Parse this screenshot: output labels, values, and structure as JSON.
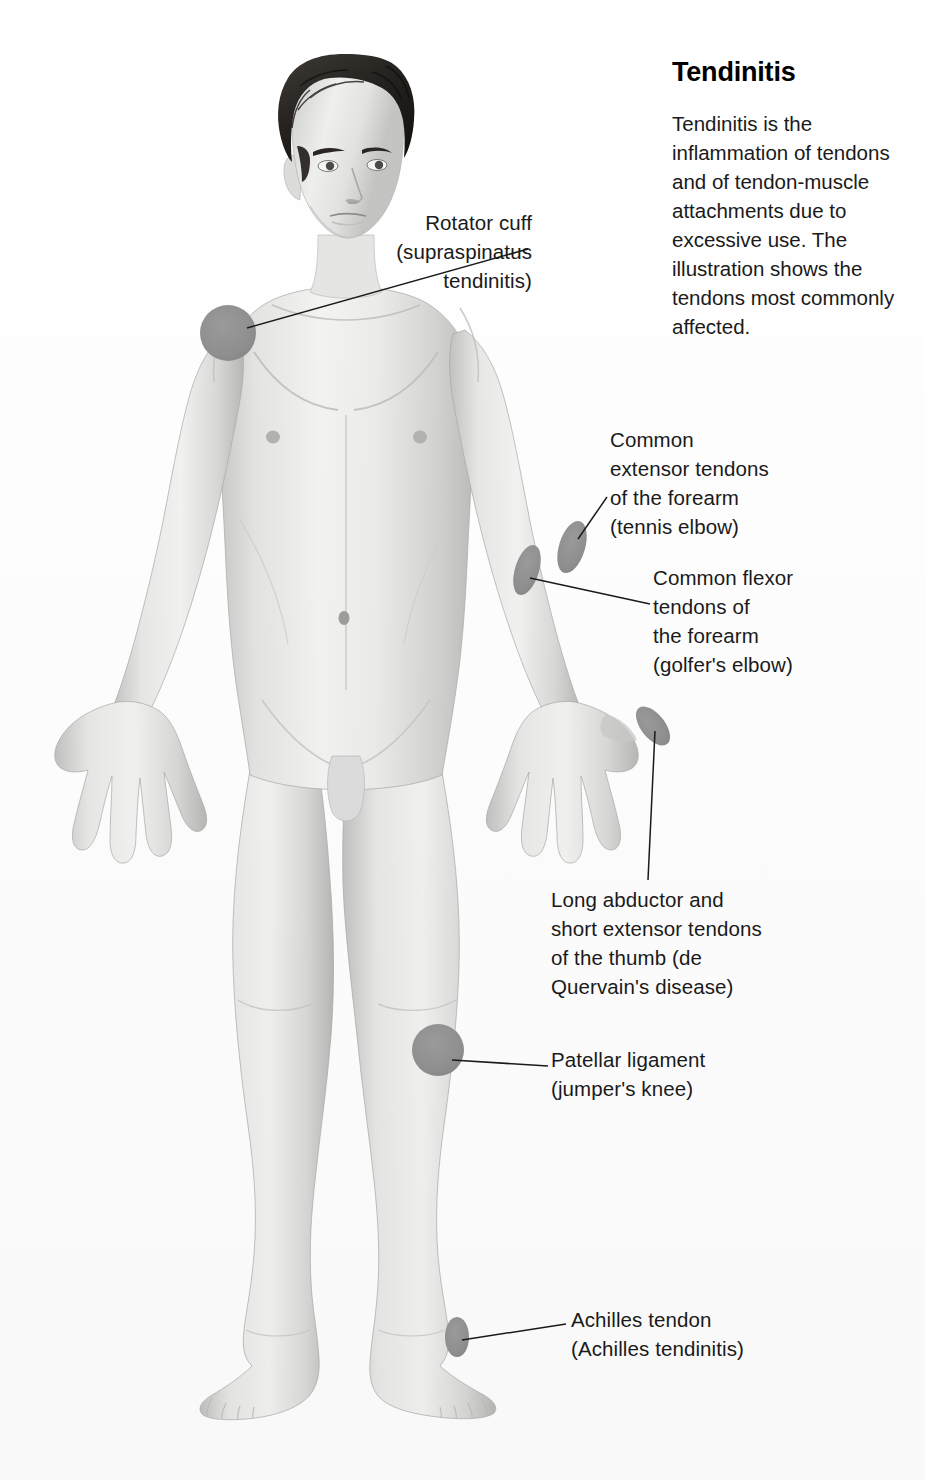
{
  "header": {
    "title": "Tendinitis",
    "body": "Tendinitis is the inflammation of tendons and of tendon-muscle attachments due to excessive use. The illustration shows the tendons most commonly affected."
  },
  "illustration": {
    "subject": "anterior view of standing male human figure, grayscale anatomical illustration",
    "marker_color": "#8e8e8e",
    "leader_line_color": "#1a1a1a",
    "skin_light": "#f2f2f0",
    "skin_mid": "#d8d8d6",
    "skin_shadow": "#b4b4b2",
    "hair_color": "#2a2724"
  },
  "callouts": [
    {
      "id": "rotator",
      "text": "Rotator cuff\n(supraspinatus\ntendinitis)",
      "align": "right",
      "marker": "shoulder-marker"
    },
    {
      "id": "extensor",
      "text": "Common\nextensor tendons\nof the forearm\n(tennis elbow)",
      "align": "left",
      "marker": "lateral-epicondyle-marker"
    },
    {
      "id": "flexor",
      "text": "Common flexor\ntendons of\nthe forearm\n(golfer's elbow)",
      "align": "left",
      "marker": "medial-epicondyle-marker"
    },
    {
      "id": "thumb",
      "text": "Long abductor and\nshort extensor tendons\nof the thumb (de\nQuervain's disease)",
      "align": "left",
      "marker": "thumb-marker"
    },
    {
      "id": "patellar",
      "text": "Patellar ligament\n(jumper's knee)",
      "align": "left",
      "marker": "knee-marker"
    },
    {
      "id": "achilles",
      "text": "Achilles tendon\n(Achilles tendinitis)",
      "align": "left",
      "marker": "achilles-marker"
    }
  ]
}
